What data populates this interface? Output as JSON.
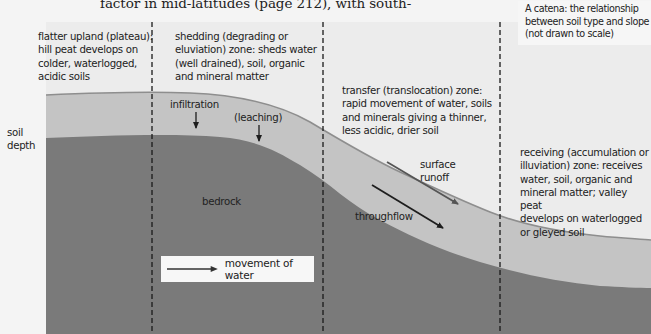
{
  "page_text": "factor in mid-latitudes (page 212), with south-",
  "caption": {
    "line1": "A catena: the relationship",
    "line2": "between soil type and slope",
    "line3": "(not drawn to scale)"
  },
  "axis_label": {
    "line1": "soil",
    "line2": "depth"
  },
  "zones": [
    {
      "name": "flatter-upland",
      "lines": [
        "flatter upland (plateau):",
        "hill peat develops on",
        "colder, waterlogged,",
        "acidic soils"
      ]
    },
    {
      "name": "shedding",
      "lines": [
        "shedding (degrading or",
        "eluviation) zone: sheds water",
        "(well drained), soil, organic",
        "and mineral matter"
      ]
    },
    {
      "name": "transfer",
      "lines": [
        "transfer (translocation) zone:",
        "rapid movement of water, soils",
        "and minerals giving a thinner,",
        "less acidic, drier soil"
      ]
    },
    {
      "name": "receiving",
      "lines": [
        "receiving (accumulation or",
        "illuviation) zone: receives",
        "water, soil, organic and",
        "mineral matter; valley peat",
        "develops on waterlogged",
        "or gleyed soil"
      ]
    }
  ],
  "process_labels": {
    "infiltration": "infiltration",
    "leaching": "(leaching)",
    "surface_runoff_1": "surface",
    "surface_runoff_2": "runoff",
    "throughflow": "throughflow",
    "bedrock": "bedrock"
  },
  "legend": {
    "label": "movement of water"
  },
  "colors": {
    "sky": "#ececec",
    "soil": "#c4c4c4",
    "bedrock": "#7a7a7a",
    "surface_line": "#8e8e8e",
    "arrow": "#1e1e1e",
    "runoff_arrow": "#555555"
  }
}
